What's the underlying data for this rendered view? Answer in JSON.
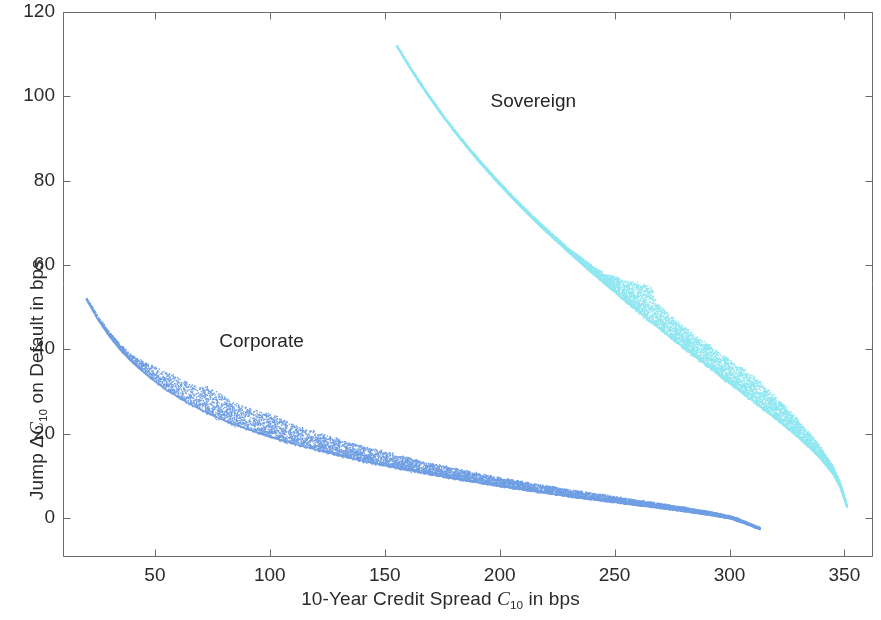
{
  "chart_data": {
    "type": "scatter",
    "title": "",
    "xlabel": "10-Year Credit Spread C10 in bps",
    "xlabel_parts": {
      "pre": "10-Year Credit Spread ",
      "sym": "C",
      "sub": "10",
      "post": " in bps"
    },
    "ylabel": "Jump ΔC10 on Default in bps",
    "ylabel_parts": {
      "pre": "Jump Δ",
      "sym": "C",
      "sub": "10",
      "post": " on Default in bps"
    },
    "xlim": [
      10,
      362
    ],
    "ylim": [
      -9,
      120
    ],
    "xticks": [
      50,
      100,
      150,
      200,
      250,
      300,
      350
    ],
    "xtick_labels": [
      "50",
      "100",
      "150",
      "200",
      "250",
      "300",
      "350"
    ],
    "yticks": [
      0,
      20,
      40,
      60,
      80,
      100,
      120
    ],
    "ytick_labels": [
      "0",
      "20",
      "40",
      "60",
      "80",
      "100",
      "120"
    ],
    "grid": false,
    "legend_position": "inline-annotations",
    "background": "#ffffff",
    "axis_color": "#6b6b6b",
    "series": [
      {
        "name": "Corporate",
        "color": "#6f9ee3",
        "annotation": "Corporate",
        "annotation_x": 78,
        "annotation_y": 42,
        "n_points": 9000,
        "x_start": 20,
        "x_end": 313,
        "curve_points": [
          [
            20,
            52.0
          ],
          [
            25,
            47.2
          ],
          [
            30,
            43.2
          ],
          [
            35,
            39.8
          ],
          [
            40,
            37.0
          ],
          [
            45,
            34.6
          ],
          [
            50,
            32.4
          ],
          [
            55,
            30.4
          ],
          [
            60,
            28.7
          ],
          [
            65,
            27.1
          ],
          [
            70,
            25.7
          ],
          [
            75,
            24.4
          ],
          [
            80,
            23.2
          ],
          [
            85,
            22.1
          ],
          [
            90,
            21.1
          ],
          [
            95,
            20.2
          ],
          [
            100,
            19.3
          ],
          [
            110,
            17.7
          ],
          [
            120,
            16.2
          ],
          [
            130,
            14.9
          ],
          [
            140,
            13.6
          ],
          [
            150,
            12.5
          ],
          [
            160,
            11.4
          ],
          [
            170,
            10.4
          ],
          [
            180,
            9.4
          ],
          [
            190,
            8.5
          ],
          [
            200,
            7.6
          ],
          [
            210,
            6.8
          ],
          [
            220,
            6.0
          ],
          [
            230,
            5.2
          ],
          [
            240,
            4.5
          ],
          [
            250,
            3.8
          ],
          [
            260,
            3.1
          ],
          [
            270,
            2.4
          ],
          [
            280,
            1.7
          ],
          [
            290,
            0.9
          ],
          [
            300,
            0.0
          ],
          [
            307,
            -1.3
          ],
          [
            313,
            -2.6
          ]
        ],
        "band_width": [
          [
            20,
            0.5
          ],
          [
            40,
            1.6
          ],
          [
            50,
            3.6
          ],
          [
            60,
            4.6
          ],
          [
            70,
            5.6
          ],
          [
            75,
            6.4
          ],
          [
            80,
            5.6
          ],
          [
            90,
            5.0
          ],
          [
            100,
            5.4
          ],
          [
            110,
            4.6
          ],
          [
            120,
            4.2
          ],
          [
            140,
            3.6
          ],
          [
            160,
            3.0
          ],
          [
            180,
            2.5
          ],
          [
            200,
            2.1
          ],
          [
            230,
            1.7
          ],
          [
            260,
            1.3
          ],
          [
            290,
            0.9
          ],
          [
            313,
            0.5
          ]
        ]
      },
      {
        "name": "Sovereign",
        "color": "#8fe7f0",
        "annotation": "Sovereign",
        "annotation_x": 196,
        "annotation_y": 99,
        "n_points": 9000,
        "x_start": 155,
        "x_end": 351,
        "curve_points": [
          [
            155,
            112.0
          ],
          [
            160,
            107.5
          ],
          [
            165,
            103.2
          ],
          [
            170,
            99.2
          ],
          [
            175,
            95.4
          ],
          [
            180,
            91.8
          ],
          [
            185,
            88.4
          ],
          [
            190,
            85.1
          ],
          [
            195,
            82.0
          ],
          [
            200,
            79.0
          ],
          [
            205,
            76.1
          ],
          [
            210,
            73.3
          ],
          [
            215,
            70.6
          ],
          [
            220,
            68.0
          ],
          [
            225,
            65.5
          ],
          [
            230,
            63.0
          ],
          [
            235,
            60.6
          ],
          [
            240,
            58.2
          ],
          [
            245,
            55.9
          ],
          [
            250,
            53.6
          ],
          [
            255,
            51.3
          ],
          [
            260,
            49.1
          ],
          [
            265,
            46.9
          ],
          [
            270,
            44.7
          ],
          [
            275,
            42.5
          ],
          [
            280,
            40.4
          ],
          [
            285,
            38.3
          ],
          [
            290,
            36.2
          ],
          [
            295,
            34.1
          ],
          [
            300,
            32.0
          ],
          [
            305,
            29.9
          ],
          [
            310,
            27.8
          ],
          [
            315,
            25.7
          ],
          [
            320,
            23.6
          ],
          [
            325,
            21.4
          ],
          [
            330,
            19.1
          ],
          [
            335,
            16.6
          ],
          [
            340,
            13.8
          ],
          [
            345,
            10.4
          ],
          [
            348,
            7.4
          ],
          [
            351,
            2.6
          ]
        ],
        "band_width": [
          [
            155,
            0.4
          ],
          [
            180,
            0.5
          ],
          [
            210,
            0.7
          ],
          [
            230,
            1.0
          ],
          [
            245,
            2.2
          ],
          [
            252,
            4.4
          ],
          [
            258,
            6.0
          ],
          [
            263,
            7.4
          ],
          [
            266,
            8.2
          ],
          [
            268,
            5.8
          ],
          [
            275,
            5.2
          ],
          [
            285,
            5.0
          ],
          [
            295,
            5.4
          ],
          [
            305,
            5.6
          ],
          [
            313,
            6.2
          ],
          [
            318,
            5.2
          ],
          [
            325,
            4.6
          ],
          [
            332,
            3.8
          ],
          [
            340,
            2.8
          ],
          [
            346,
            1.6
          ],
          [
            351,
            0.6
          ]
        ]
      }
    ]
  },
  "plot_box": {
    "left": 63,
    "top": 12,
    "right": 872,
    "bottom": 556
  }
}
